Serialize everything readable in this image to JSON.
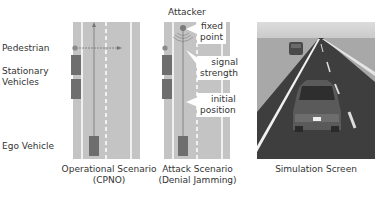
{
  "panels": [
    {
      "id": "operational",
      "caption_line1": "Operational Scenario",
      "caption_line2": "(CPNO)",
      "labels": {
        "pedestrian": "Pedestrian",
        "stationary_line1": "Stationary",
        "stationary_line2": "Vehicles",
        "ego": "Ego Vehicle"
      }
    },
    {
      "id": "attack",
      "caption_line1": "Attack Scenario",
      "caption_line2": "(Denial Jamming)",
      "labels": {
        "attacker": "Attacker"
      },
      "callouts": [
        {
          "line1": "fixed",
          "line2": "point"
        },
        {
          "line1": "signal",
          "line2": "strength"
        },
        {
          "line1": "initial",
          "line2": "position"
        }
      ]
    },
    {
      "id": "simulation",
      "caption_line1": "Simulation Screen"
    }
  ],
  "colors": {
    "road": "#c4c4c4",
    "vehicle": "#6e6e6e",
    "marker": "#7a7a7a",
    "line": "#ffffff"
  }
}
